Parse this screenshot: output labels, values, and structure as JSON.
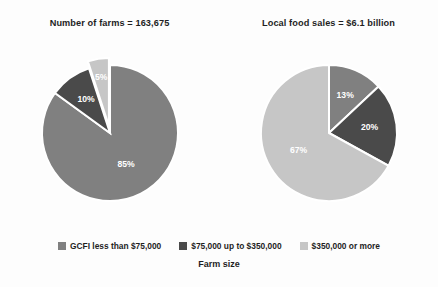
{
  "chart_data": [
    {
      "type": "pie",
      "title": "Number of farms = 163,675",
      "categories": [
        "GCFI less than $75,000",
        "$75,000 up to $350,000",
        "$350,000 or more"
      ],
      "values": [
        85,
        10,
        5
      ],
      "value_labels": [
        "85%",
        "10%",
        "5%"
      ],
      "colors": [
        "#808080",
        "#4a4a4a",
        "#c6c6c6"
      ],
      "exploded": [
        false,
        false,
        true
      ],
      "start_angle_deg": 0,
      "direction": "clockwise",
      "units": "percent",
      "legend_position": "bottom",
      "grid": false
    },
    {
      "type": "pie",
      "title": "Local food sales = $6.1 billion",
      "categories": [
        "GCFI less than $75,000",
        "$75,000 up to $350,000",
        "$350,000 or more"
      ],
      "values": [
        13,
        20,
        67
      ],
      "value_labels": [
        "13%",
        "20%",
        "67%"
      ],
      "colors": [
        "#808080",
        "#4a4a4a",
        "#c6c6c6"
      ],
      "exploded": [
        false,
        false,
        false
      ],
      "start_angle_deg": 0,
      "direction": "clockwise",
      "units": "percent",
      "legend_position": "bottom",
      "grid": false
    }
  ],
  "panels": [
    {
      "title": "Number of farms = 163,675",
      "slices": [
        {
          "label": "85%",
          "value": 85,
          "color": "#808080",
          "exploded": false
        },
        {
          "label": "10%",
          "value": 10,
          "color": "#4a4a4a",
          "exploded": false
        },
        {
          "label": "5%",
          "value": 5,
          "color": "#c6c6c6",
          "exploded": true
        }
      ]
    },
    {
      "title": "Local food sales = $6.1 billion",
      "slices": [
        {
          "label": "13%",
          "value": 13,
          "color": "#808080",
          "exploded": false
        },
        {
          "label": "20%",
          "value": 20,
          "color": "#4a4a4a",
          "exploded": false
        },
        {
          "label": "67%",
          "value": 67,
          "color": "#c6c6c6",
          "exploded": false
        }
      ]
    }
  ],
  "legend": {
    "items": [
      {
        "label": "GCFI less than $75,000",
        "color": "#808080"
      },
      {
        "label": "$75,000 up to $350,000",
        "color": "#4a4a4a"
      },
      {
        "label": "$350,000 or more",
        "color": "#c6c6c6"
      }
    ]
  },
  "axis": {
    "label": "Farm size"
  },
  "theme": {
    "background": "#fdfdfd",
    "text_color": "#1f1f1f",
    "slice_label_color": "#ffffff",
    "slice_edge_color": "#ffffff"
  }
}
